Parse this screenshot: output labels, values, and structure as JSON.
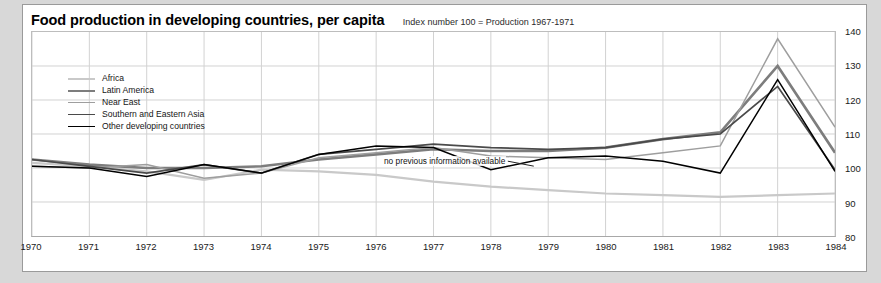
{
  "chart_title": "Food production in developing countries, per capita",
  "chart_subtitle": "Index number 100 = Production 1967-1971",
  "annotation": {
    "text": "no previous information available"
  },
  "legend": {
    "items": [
      {
        "label": "Africa",
        "color": "#c9c9c9"
      },
      {
        "label": "Latin America",
        "color": "#7d7d7d"
      },
      {
        "label": "Near East",
        "color": "#9e9e9e"
      },
      {
        "label": "Southern and Eastern Asia",
        "color": "#4a4a4a"
      },
      {
        "label": "Other developing countries",
        "color": "#000000"
      }
    ]
  },
  "axes": {
    "y_ticks": [
      80,
      90,
      100,
      110,
      120,
      130,
      140
    ],
    "x_ticks": [
      "1970",
      "1971",
      "1972",
      "1973",
      "1974",
      "1975",
      "1976",
      "1977",
      "1978",
      "1979",
      "1980",
      "1981",
      "1982",
      "1983",
      "1984"
    ]
  },
  "chart_data": {
    "type": "line",
    "title": "Food production in developing countries, per capita",
    "subtitle": "Index number 100 = Production 1967-1971",
    "xlabel": "",
    "ylabel": "Index number 100 = Production 1967-1971",
    "x": [
      1970,
      1971,
      1972,
      1973,
      1974,
      1975,
      1976,
      1977,
      1978,
      1979,
      1980,
      1981,
      1982,
      1983,
      1984
    ],
    "xlim": [
      1970,
      1984
    ],
    "ylim": [
      80,
      140
    ],
    "grid": true,
    "legend_position": "top-left",
    "annotations": [
      {
        "text": "no previous information available",
        "x": 1977.6,
        "y": 102
      }
    ],
    "series": [
      {
        "name": "Africa",
        "color": "#c9c9c9",
        "values": [
          101.5,
          100.5,
          99.0,
          96.5,
          99.5,
          99.0,
          98.0,
          96.0,
          94.5,
          93.5,
          92.5,
          92.0,
          91.5,
          92.0,
          92.5
        ]
      },
      {
        "name": "Latin America",
        "color": "#7d7d7d",
        "values": [
          102.5,
          101.0,
          100.0,
          100.0,
          100.5,
          102.5,
          104.0,
          105.5,
          105.0,
          105.0,
          106.0,
          108.5,
          110.5,
          130.0,
          104.5
        ]
      },
      {
        "name": "Near East",
        "color": "#9e9e9e",
        "values": [
          100.5,
          100.0,
          101.0,
          97.0,
          98.5,
          103.0,
          104.5,
          106.0,
          103.5,
          103.0,
          102.5,
          104.5,
          106.5,
          138.0,
          112.0
        ]
      },
      {
        "name": "Southern and Eastern Asia",
        "color": "#4a4a4a",
        "values": [
          102.5,
          100.5,
          98.5,
          101.0,
          98.5,
          104.0,
          105.5,
          107.0,
          106.0,
          105.5,
          106.0,
          108.5,
          110.0,
          124.0,
          99.5
        ]
      },
      {
        "name": "Other developing countries",
        "color": "#000000",
        "values": [
          100.5,
          100.0,
          97.5,
          101.0,
          98.5,
          104.0,
          106.5,
          106.0,
          99.5,
          103.0,
          103.5,
          102.0,
          98.5,
          126.0,
          99.0
        ]
      }
    ]
  }
}
